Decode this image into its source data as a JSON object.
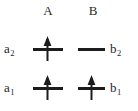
{
  "figure": {
    "type": "energy-level-diagram",
    "background_color": "#ffffff",
    "line_color": "#1c1c1c",
    "text_color": "#1e1e1e"
  },
  "columns": [
    {
      "id": "A",
      "label": "A"
    },
    {
      "id": "B",
      "label": "B"
    }
  ],
  "levels": [
    {
      "row": "upper",
      "left_label_text": "a",
      "left_label_sub": "2",
      "right_label_text": "b",
      "right_label_sub": "2",
      "a_electrons": 1,
      "b_electrons": 0
    },
    {
      "row": "lower",
      "left_label_text": "a",
      "left_label_sub": "1",
      "right_label_text": "b",
      "right_label_sub": "1",
      "a_electrons": 1,
      "b_electrons": 1
    }
  ],
  "labels": {
    "col_a": "A",
    "col_b": "B",
    "a2_base": "a",
    "a2_sub": "2",
    "a1_base": "a",
    "a1_sub": "1",
    "b2_base": "b",
    "b2_sub": "2",
    "b1_base": "b",
    "b1_sub": "1"
  },
  "icons": {
    "up_arrow": "spin-up-arrow",
    "level_bar": "energy-level-bar"
  }
}
